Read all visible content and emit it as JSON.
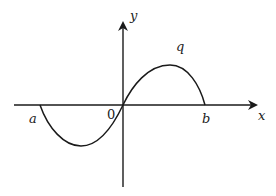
{
  "diagram": {
    "labels": {
      "y_axis": "y",
      "x_axis": "x",
      "origin": "0",
      "left_root": "a",
      "right_root": "b",
      "curve": "q"
    },
    "colors": {
      "stroke": "#1a1a1a",
      "background": "#ffffff"
    }
  }
}
